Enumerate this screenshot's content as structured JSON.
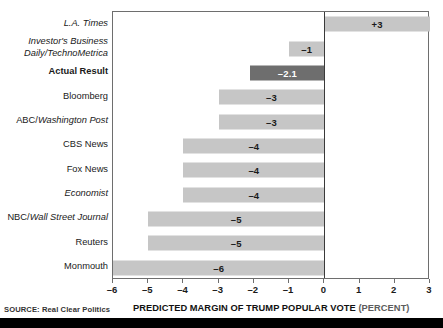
{
  "chart_data": {
    "type": "bar",
    "orientation": "horizontal",
    "title": "",
    "xlabel": "PREDICTED MARGIN OF TRUMP POPULAR VOTE (PERCENT)",
    "ylabel": "",
    "xlim": [
      -6,
      3
    ],
    "grid": false,
    "legend": "none",
    "source": "SOURCE: Real Clear Politics",
    "categories": [
      "L.A. Times",
      "Investor's Business\nDaily/TechnoMetrica",
      "Actual Result",
      "Bloomberg",
      "ABC/Washington Post",
      "CBS News",
      "Fox News",
      "Economist",
      "NBC/Wall Street Journal",
      "Reuters",
      "Monmouth"
    ],
    "values": [
      3,
      -1,
      -2.1,
      -3,
      -3,
      -4,
      -4,
      -4,
      -5,
      -5,
      -6
    ],
    "value_labels": [
      "+3",
      "–1",
      "–2.1",
      "–3",
      "–3",
      "–4",
      "–4",
      "–4",
      "–5",
      "–5",
      "–6"
    ],
    "xticks": [
      -6,
      -5,
      -4,
      -3,
      -2,
      -1,
      0,
      1,
      2,
      3
    ],
    "xtick_labels": [
      "–6",
      "–5",
      "–4",
      "–3",
      "–2",
      "–1",
      "0",
      "1",
      "2",
      "3"
    ],
    "highlight_index": 2,
    "colors": {
      "bar": "#c6c6c6",
      "bar_highlight": "#6e6e6e",
      "axis": "#6e6e6e",
      "zero_line": "#3a3a3a",
      "text": "#1a1a1a",
      "band": "#000000"
    }
  },
  "axis_title": {
    "main": "PREDICTED MARGIN OF TRUMP POPULAR VOTE ",
    "unit": "(PERCENT)"
  },
  "source_note": "SOURCE: Real Clear Politics",
  "label_styles": [
    "italic",
    "italic",
    "bold",
    "plain",
    "mixed",
    "plain",
    "plain",
    "italic",
    "mixed",
    "plain",
    "plain"
  ]
}
